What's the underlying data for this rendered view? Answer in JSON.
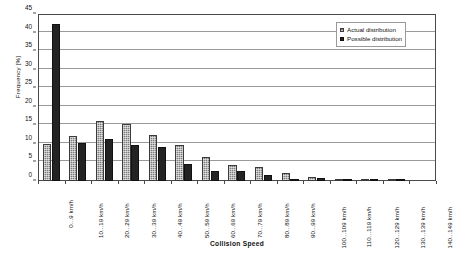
{
  "chart_data": {
    "type": "bar",
    "title": "",
    "xlabel": "Collision Speed",
    "ylabel": "Frequency [%]",
    "ylim": [
      0,
      45
    ],
    "ytick_step": 5,
    "yticks": [
      0,
      5,
      10,
      15,
      20,
      25,
      30,
      35,
      40,
      45
    ],
    "grid": true,
    "legend_position": "top-right",
    "categories": [
      "0...9 km/h",
      "10...19 km/h",
      "20...29 km/h",
      "30...39 km/h",
      "40...49 km/h",
      "50...59 km/h",
      "60...69 km/h",
      "70...79 km/h",
      "80...89 km/h",
      "90...99 km/h",
      "100...109 km/h",
      "110...119 km/h",
      "120...129 km/h",
      "130...139 km/h",
      "140...149 km/h"
    ],
    "series": [
      {
        "name": "Actual distribution",
        "color": "#7d7d7d",
        "values": [
          10.0,
          12.0,
          16.1,
          15.4,
          12.3,
          9.8,
          6.5,
          4.2,
          3.7,
          2.2,
          1.0,
          0.6,
          0.3,
          0.3,
          0.0
        ]
      },
      {
        "name": "Possible distribution",
        "color": "#232323",
        "values": [
          42.3,
          10.3,
          11.4,
          9.8,
          9.3,
          4.7,
          2.7,
          2.6,
          1.7,
          0.1,
          0.9,
          0.2,
          0.1,
          0.1,
          0.0
        ]
      }
    ]
  },
  "legend": {
    "items": [
      {
        "label": "Actual distribution",
        "swatch": "actual"
      },
      {
        "label": "Possible distribution",
        "swatch": "possible"
      }
    ]
  }
}
